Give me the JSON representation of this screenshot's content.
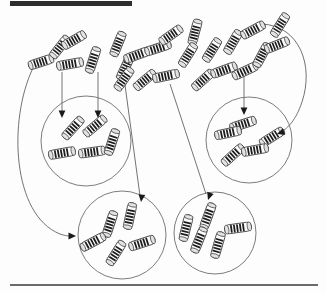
{
  "figure": {
    "type": "diagram",
    "canvas": {
      "width": 326,
      "height": 293
    },
    "background_color": "#fdfdfd",
    "ink_color": "#1c1c1c",
    "line_color": "#5a5a5a",
    "circle_stroke_color": "#6d6d6d"
  },
  "decorations": {
    "top_bar": {
      "name": "top-rule-bar",
      "x": 10,
      "y": 1,
      "width": 122,
      "height": 5,
      "color": "#2e2e2e"
    },
    "bottom_rule": {
      "name": "bottom-rule-line",
      "x1": 10,
      "y1": 285,
      "x2": 318,
      "y2": 285,
      "color": "#3a3a3a"
    }
  },
  "clusters": [
    {
      "id": "cluster-upper-left",
      "label": "upper-left-cluster",
      "cx": 86,
      "cy": 141,
      "r": 45
    },
    {
      "id": "cluster-upper-right",
      "label": "upper-right-cluster",
      "cx": 249,
      "cy": 140,
      "r": 43
    },
    {
      "id": "cluster-lower-left",
      "label": "lower-left-cluster",
      "cx": 122,
      "cy": 235,
      "r": 44
    },
    {
      "id": "cluster-lower-right",
      "label": "lower-right-cluster",
      "cx": 215,
      "cy": 233,
      "r": 41
    }
  ],
  "scattered_items": [
    {
      "x": 41,
      "y": 62,
      "angle": -18,
      "len": 26,
      "w": 9,
      "bands": 5
    },
    {
      "x": 60,
      "y": 47,
      "angle": -52,
      "len": 26,
      "w": 9,
      "bands": 5
    },
    {
      "x": 74,
      "y": 40,
      "angle": -30,
      "len": 26,
      "w": 9,
      "bands": 5
    },
    {
      "x": 70,
      "y": 64,
      "angle": -10,
      "len": 27,
      "w": 9,
      "bands": 5
    },
    {
      "x": 93,
      "y": 60,
      "angle": -72,
      "len": 27,
      "w": 9,
      "bands": 5
    },
    {
      "x": 118,
      "y": 44,
      "angle": -68,
      "len": 26,
      "w": 9,
      "bands": 5
    },
    {
      "x": 125,
      "y": 68,
      "angle": -65,
      "len": 26,
      "w": 9,
      "bands": 5
    },
    {
      "x": 137,
      "y": 55,
      "angle": -20,
      "len": 27,
      "w": 9,
      "bands": 5
    },
    {
      "x": 158,
      "y": 48,
      "angle": -18,
      "len": 27,
      "w": 9,
      "bands": 5
    },
    {
      "x": 124,
      "y": 79,
      "angle": -55,
      "len": 26,
      "w": 9,
      "bands": 5
    },
    {
      "x": 145,
      "y": 80,
      "angle": -40,
      "len": 26,
      "w": 9,
      "bands": 5
    },
    {
      "x": 166,
      "y": 76,
      "angle": -12,
      "len": 27,
      "w": 9,
      "bands": 5
    },
    {
      "x": 171,
      "y": 35,
      "angle": -35,
      "len": 26,
      "w": 9,
      "bands": 5
    },
    {
      "x": 195,
      "y": 32,
      "angle": -75,
      "len": 26,
      "w": 9,
      "bands": 5
    },
    {
      "x": 188,
      "y": 55,
      "angle": -58,
      "len": 26,
      "w": 9,
      "bands": 5
    },
    {
      "x": 212,
      "y": 50,
      "angle": -58,
      "len": 26,
      "w": 9,
      "bands": 5
    },
    {
      "x": 203,
      "y": 80,
      "angle": -42,
      "len": 26,
      "w": 9,
      "bands": 5
    },
    {
      "x": 224,
      "y": 70,
      "angle": -20,
      "len": 27,
      "w": 9,
      "bands": 5
    },
    {
      "x": 233,
      "y": 42,
      "angle": -60,
      "len": 26,
      "w": 9,
      "bands": 5
    },
    {
      "x": 253,
      "y": 30,
      "angle": -28,
      "len": 26,
      "w": 9,
      "bands": 5
    },
    {
      "x": 245,
      "y": 71,
      "angle": -25,
      "len": 27,
      "w": 9,
      "bands": 5
    },
    {
      "x": 262,
      "y": 55,
      "angle": -62,
      "len": 26,
      "w": 9,
      "bands": 5
    },
    {
      "x": 277,
      "y": 45,
      "angle": -22,
      "len": 26,
      "w": 9,
      "bands": 5
    },
    {
      "x": 280,
      "y": 25,
      "angle": -58,
      "len": 26,
      "w": 9,
      "bands": 5
    }
  ],
  "clustered_items": [
    {
      "cluster": "cluster-upper-left",
      "x": 73,
      "y": 128,
      "angle": -48,
      "len": 27,
      "w": 9,
      "bands": 5
    },
    {
      "cluster": "cluster-upper-left",
      "x": 95,
      "y": 126,
      "angle": -40,
      "len": 27,
      "w": 9,
      "bands": 5
    },
    {
      "cluster": "cluster-upper-left",
      "x": 62,
      "y": 153,
      "angle": -10,
      "len": 27,
      "w": 9,
      "bands": 5
    },
    {
      "cluster": "cluster-upper-left",
      "x": 92,
      "y": 152,
      "angle": -8,
      "len": 27,
      "w": 9,
      "bands": 5
    },
    {
      "cluster": "cluster-upper-left",
      "x": 112,
      "y": 142,
      "angle": -72,
      "len": 27,
      "w": 9,
      "bands": 5
    },
    {
      "cluster": "cluster-upper-right",
      "x": 243,
      "y": 124,
      "angle": -18,
      "len": 27,
      "w": 9,
      "bands": 5
    },
    {
      "cluster": "cluster-upper-right",
      "x": 228,
      "y": 133,
      "angle": -12,
      "len": 27,
      "w": 9,
      "bands": 5
    },
    {
      "cluster": "cluster-upper-right",
      "x": 272,
      "y": 137,
      "angle": -32,
      "len": 27,
      "w": 9,
      "bands": 5
    },
    {
      "cluster": "cluster-upper-right",
      "x": 233,
      "y": 155,
      "angle": -42,
      "len": 27,
      "w": 9,
      "bands": 5
    },
    {
      "cluster": "cluster-upper-right",
      "x": 255,
      "y": 150,
      "angle": -10,
      "len": 27,
      "w": 9,
      "bands": 5
    },
    {
      "cluster": "cluster-lower-left",
      "x": 130,
      "y": 216,
      "angle": -78,
      "len": 27,
      "w": 9,
      "bands": 5
    },
    {
      "cluster": "cluster-lower-left",
      "x": 110,
      "y": 224,
      "angle": -72,
      "len": 27,
      "w": 9,
      "bands": 5
    },
    {
      "cluster": "cluster-lower-left",
      "x": 93,
      "y": 242,
      "angle": -28,
      "len": 27,
      "w": 9,
      "bands": 5
    },
    {
      "cluster": "cluster-lower-left",
      "x": 116,
      "y": 253,
      "angle": -58,
      "len": 27,
      "w": 9,
      "bands": 5
    },
    {
      "cluster": "cluster-lower-left",
      "x": 142,
      "y": 243,
      "angle": -18,
      "len": 27,
      "w": 9,
      "bands": 5
    },
    {
      "cluster": "cluster-lower-right",
      "x": 208,
      "y": 216,
      "angle": -70,
      "len": 27,
      "w": 9,
      "bands": 5
    },
    {
      "cluster": "cluster-lower-right",
      "x": 186,
      "y": 228,
      "angle": -76,
      "len": 27,
      "w": 9,
      "bands": 5
    },
    {
      "cluster": "cluster-lower-right",
      "x": 199,
      "y": 240,
      "angle": -68,
      "len": 27,
      "w": 9,
      "bands": 5
    },
    {
      "cluster": "cluster-lower-right",
      "x": 218,
      "y": 245,
      "angle": -74,
      "len": 27,
      "w": 9,
      "bands": 5
    },
    {
      "cluster": "cluster-lower-right",
      "x": 238,
      "y": 228,
      "angle": -8,
      "len": 27,
      "w": 9,
      "bands": 5
    }
  ],
  "arrows": [
    {
      "name": "arrow-to-upper-left-a",
      "path": "M 62 72 L 62 113",
      "head_x": 62,
      "head_y": 118,
      "head_angle": 90,
      "kind": "straight"
    },
    {
      "name": "arrow-to-upper-left-b",
      "path": "M 98 72 L 98 113",
      "head_x": 98,
      "head_y": 118,
      "head_angle": 90,
      "kind": "straight"
    },
    {
      "name": "arrow-to-upper-right",
      "path": "M 244 76 L 244 110",
      "head_x": 244,
      "head_y": 115,
      "head_angle": 90,
      "kind": "straight"
    },
    {
      "name": "arrow-to-lower-left",
      "path": "M 125 85 L 140 196",
      "head_x": 141,
      "head_y": 202,
      "head_angle": 97,
      "kind": "straight"
    },
    {
      "name": "arrow-to-lower-right",
      "path": "M 170 84 L 206 194",
      "head_x": 208,
      "head_y": 200,
      "head_angle": 109,
      "kind": "straight"
    },
    {
      "name": "arrow-curved-left-to-lower-left",
      "path": "M 33 68 C 8 120, 12 215, 60 234 C 66 236, 68 236, 72 236",
      "head_x": 76,
      "head_y": 236,
      "head_angle": 0,
      "kind": "curved"
    },
    {
      "name": "arrow-curved-right-to-upper-right",
      "path": "M 262 24 C 300 26, 314 66, 302 102 C 296 120, 288 128, 281 132",
      "head_x": 277,
      "head_y": 134,
      "head_angle": 160,
      "kind": "curved"
    }
  ]
}
